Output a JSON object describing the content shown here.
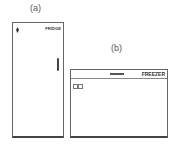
{
  "labels": {
    "a": "(a)",
    "b": "(b)"
  },
  "fridge": {
    "brand": "FRIDGE"
  },
  "freezer": {
    "brand": "FREEZER"
  }
}
